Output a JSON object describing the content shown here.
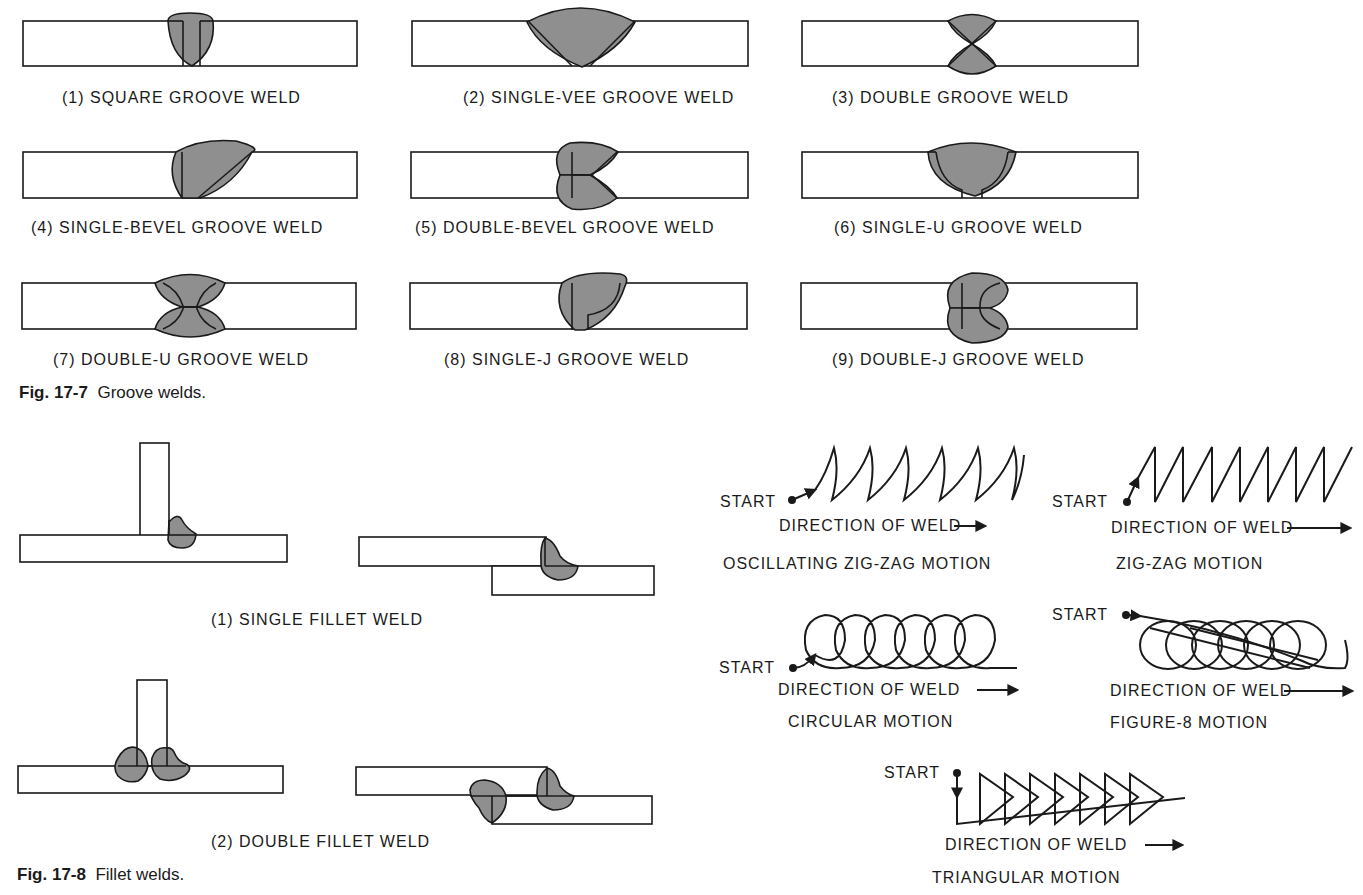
{
  "groove_figure": {
    "caption_number": "Fig. 17-7",
    "caption_text": "Groove welds.",
    "welds": [
      {
        "label": "(1)  SQUARE GROOVE WELD"
      },
      {
        "label": "(2)  SINGLE-VEE GROOVE WELD"
      },
      {
        "label": "(3)  DOUBLE GROOVE WELD"
      },
      {
        "label": "(4)  SINGLE-BEVEL GROOVE WELD"
      },
      {
        "label": "(5)  DOUBLE-BEVEL GROOVE WELD"
      },
      {
        "label": "(6)  SINGLE-U GROOVE WELD"
      },
      {
        "label": "(7)  DOUBLE-U GROOVE WELD"
      },
      {
        "label": "(8)  SINGLE-J GROOVE WELD"
      },
      {
        "label": "(9)  DOUBLE-J GROOVE WELD"
      }
    ]
  },
  "fillet_figure": {
    "caption_number": "Fig. 17-8",
    "caption_text": "Fillet welds.",
    "welds": [
      {
        "label": "(1)  SINGLE FILLET WELD"
      },
      {
        "label": "(2)  DOUBLE FILLET WELD"
      }
    ]
  },
  "motions": {
    "start_label": "START",
    "direction_label": "DIRECTION OF WELD",
    "items": [
      {
        "name": "OSCILLATING ZIG-ZAG MOTION"
      },
      {
        "name": "ZIG-ZAG MOTION"
      },
      {
        "name": "CIRCULAR MOTION"
      },
      {
        "name": "FIGURE-8 MOTION"
      },
      {
        "name": "TRIANGULAR MOTION"
      }
    ]
  },
  "colors": {
    "weld_fill": "#8f8f8f",
    "line": "#1a1a1a",
    "background": "#ffffff"
  }
}
